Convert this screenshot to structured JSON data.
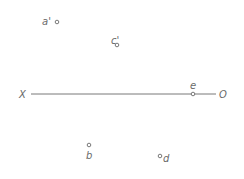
{
  "diagram": {
    "type": "orthographic-projection",
    "axis": {
      "start_label": "X",
      "end_label": "O",
      "color": "#6a6a6a"
    },
    "points": [
      {
        "id": "a_prime",
        "label": "a'",
        "region": "above-axis"
      },
      {
        "id": "c_prime",
        "label": "c'",
        "region": "above-axis"
      },
      {
        "id": "e",
        "label": "e",
        "region": "on-axis"
      },
      {
        "id": "b",
        "label": "b",
        "region": "below-axis"
      },
      {
        "id": "d",
        "label": "d",
        "region": "below-axis"
      }
    ]
  }
}
